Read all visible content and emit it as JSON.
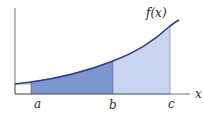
{
  "diagram": {
    "function_label": "f(x)",
    "x_axis_label": "x",
    "points": [
      {
        "label": "a",
        "x": 31
      },
      {
        "label": "b",
        "x": 113
      },
      {
        "label": "c",
        "x": 170
      }
    ],
    "colors": {
      "curve": "#2b3f8a",
      "region_ab": "#7e95cf",
      "region_bc": "#c8d4f0",
      "axis": "#555555",
      "background": "#ffffff"
    }
  }
}
